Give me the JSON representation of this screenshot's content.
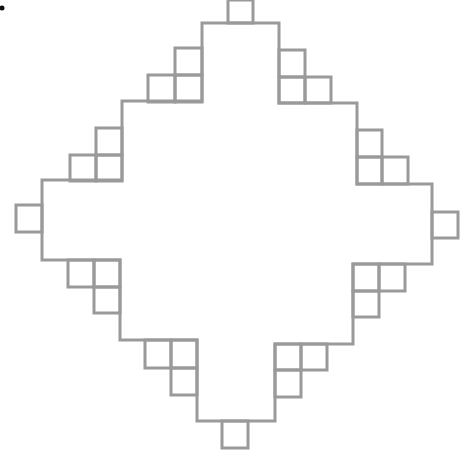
{
  "diagram": {
    "type": "fractal-staircase-shape",
    "stroke_color": "#9a9a9a",
    "background_color": "#ffffff",
    "grid_unit_px": 26,
    "marker_dot": {
      "x": 2,
      "y": 8,
      "color": "#111111"
    },
    "outline_points": [
      [
        203,
        23
      ],
      [
        228,
        23
      ],
      [
        253,
        23
      ],
      [
        279,
        23
      ],
      [
        279,
        103
      ],
      [
        357,
        103
      ],
      [
        357,
        184
      ],
      [
        432,
        184
      ],
      [
        432,
        264
      ],
      [
        353,
        264
      ],
      [
        353,
        344
      ],
      [
        275,
        344
      ],
      [
        275,
        421
      ],
      [
        197,
        421
      ],
      [
        197,
        340
      ],
      [
        120,
        340
      ],
      [
        120,
        260
      ],
      [
        42,
        260
      ],
      [
        42,
        180
      ],
      [
        122,
        180
      ],
      [
        122,
        101
      ],
      [
        202,
        101
      ],
      [
        202,
        23
      ]
    ],
    "cells": [
      {
        "id": "top",
        "x": 228,
        "y": 0,
        "w": 25,
        "h": 23
      },
      {
        "id": "ul-1",
        "x": 175,
        "y": 48,
        "w": 27,
        "h": 27
      },
      {
        "id": "ul-2",
        "x": 148,
        "y": 75,
        "w": 27,
        "h": 27
      },
      {
        "id": "ul-3",
        "x": 175,
        "y": 75,
        "w": 27,
        "h": 27
      },
      {
        "id": "ul-4",
        "x": 96,
        "y": 128,
        "w": 26,
        "h": 27
      },
      {
        "id": "ul-5",
        "x": 70,
        "y": 155,
        "w": 26,
        "h": 26
      },
      {
        "id": "ul-6",
        "x": 96,
        "y": 155,
        "w": 26,
        "h": 26
      },
      {
        "id": "left",
        "x": 16,
        "y": 205,
        "w": 26,
        "h": 27
      },
      {
        "id": "ll-1",
        "x": 68,
        "y": 260,
        "w": 26,
        "h": 27
      },
      {
        "id": "ll-2",
        "x": 94,
        "y": 260,
        "w": 26,
        "h": 27
      },
      {
        "id": "ll-3",
        "x": 94,
        "y": 287,
        "w": 26,
        "h": 26
      },
      {
        "id": "ll-4",
        "x": 145,
        "y": 340,
        "w": 26,
        "h": 28
      },
      {
        "id": "ll-5",
        "x": 171,
        "y": 340,
        "w": 26,
        "h": 28
      },
      {
        "id": "ll-6",
        "x": 171,
        "y": 368,
        "w": 26,
        "h": 27
      },
      {
        "id": "bottom",
        "x": 222,
        "y": 421,
        "w": 26,
        "h": 27
      },
      {
        "id": "lr-1",
        "x": 275,
        "y": 344,
        "w": 26,
        "h": 26
      },
      {
        "id": "lr-2",
        "x": 301,
        "y": 344,
        "w": 26,
        "h": 26
      },
      {
        "id": "lr-3",
        "x": 275,
        "y": 370,
        "w": 26,
        "h": 27
      },
      {
        "id": "lr-4",
        "x": 353,
        "y": 264,
        "w": 26,
        "h": 27
      },
      {
        "id": "lr-5",
        "x": 379,
        "y": 264,
        "w": 26,
        "h": 27
      },
      {
        "id": "lr-6",
        "x": 353,
        "y": 291,
        "w": 26,
        "h": 26
      },
      {
        "id": "right",
        "x": 432,
        "y": 212,
        "w": 26,
        "h": 26
      },
      {
        "id": "ur-1",
        "x": 357,
        "y": 130,
        "w": 25,
        "h": 27
      },
      {
        "id": "ur-2",
        "x": 357,
        "y": 157,
        "w": 25,
        "h": 27
      },
      {
        "id": "ur-3",
        "x": 382,
        "y": 157,
        "w": 26,
        "h": 27
      },
      {
        "id": "ur-4",
        "x": 279,
        "y": 50,
        "w": 26,
        "h": 27
      },
      {
        "id": "ur-5",
        "x": 279,
        "y": 77,
        "w": 26,
        "h": 26
      },
      {
        "id": "ur-6",
        "x": 305,
        "y": 77,
        "w": 26,
        "h": 26
      }
    ]
  }
}
